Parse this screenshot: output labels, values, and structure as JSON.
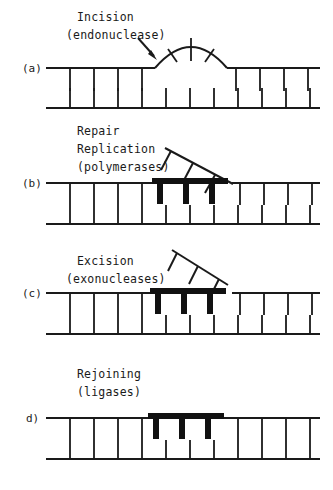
{
  "figure": {
    "background_color": "#ffffff",
    "ink_color": "#1a1a1a",
    "width": 333,
    "height": 490
  },
  "panels": [
    {
      "id": "a",
      "label": "(a)",
      "caption_line1": "Incision",
      "caption_line2": "(endonuclease)",
      "enzyme": "endonuclease",
      "has_arrow": true,
      "feature": "arc-bulge-with-three-spokes",
      "description": "Top strand nicked; damaged region bulges outward as an arc"
    },
    {
      "id": "b",
      "label": "(b)",
      "caption_line1": "Repair",
      "caption_line2": "Replication",
      "caption_line3": "(polymerases)",
      "enzyme": "polymerases",
      "has_arrow": false,
      "feature": "diagonal-displaced-flap-attached-plus-new-thick-strand",
      "description": "New strand (thick) synthesized; damaged strand displaced as diagonal flap still attached"
    },
    {
      "id": "c",
      "label": "(c)",
      "caption_line1": "Excision",
      "caption_line2": "(exonucleases)",
      "enzyme": "exonucleases",
      "has_arrow": false,
      "feature": "detached-diagonal-flap-plus-thick-strand",
      "description": "Displaced damaged flap released; thick new strand remains with gap at right"
    },
    {
      "id": "d",
      "label": "d)",
      "caption_line1": "Rejoining",
      "caption_line2": "(ligases)",
      "enzyme": "ligases",
      "has_arrow": false,
      "feature": "continuous-duplex-with-thick-patch",
      "description": "Nick sealed; duplex continuous with repaired thick patch"
    }
  ]
}
